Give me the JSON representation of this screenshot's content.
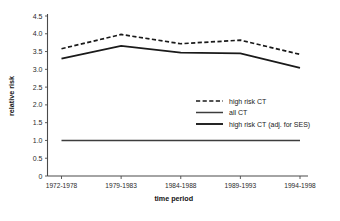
{
  "chart_data": {
    "type": "line",
    "title": "",
    "xlabel": "time period",
    "ylabel": "relative risk",
    "categories": [
      "1972-1978",
      "1979-1983",
      "1984-1988",
      "1989-1993",
      "1994-1998"
    ],
    "ylim": [
      0,
      4.5
    ],
    "yticks": [
      "0",
      "0.5",
      "1.0",
      "1.5",
      "2.0",
      "2.5",
      "3.0",
      "3.5",
      "4.0",
      "4.5"
    ],
    "ytick_values": [
      0,
      0.5,
      1.0,
      1.5,
      2.0,
      2.5,
      3.0,
      3.5,
      4.0,
      4.5
    ],
    "grid": false,
    "legend_position": "center-right",
    "series": [
      {
        "name": "high risk CT",
        "style": "dashed",
        "color": "#1a1a1a",
        "values": [
          3.58,
          3.98,
          3.72,
          3.82,
          3.42
        ]
      },
      {
        "name": "all CT",
        "style": "solid-thin",
        "color": "#3d3d3d",
        "values": [
          1.0,
          1.0,
          1.0,
          1.0,
          1.0
        ]
      },
      {
        "name": "high risk CT (adj. for SES)",
        "style": "solid-thick",
        "color": "#1a1a1a",
        "values": [
          3.3,
          3.66,
          3.47,
          3.45,
          3.04
        ]
      }
    ]
  },
  "legend": {
    "items": [
      {
        "label": "high risk CT"
      },
      {
        "label": "all CT"
      },
      {
        "label": "high risk CT (adj. for SES)"
      }
    ]
  }
}
